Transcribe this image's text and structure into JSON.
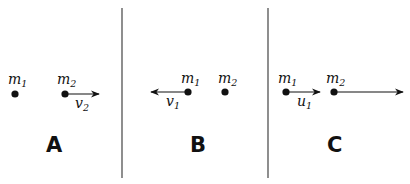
{
  "panels": [
    {
      "id": "A",
      "label": "A",
      "masses": [
        {
          "name": "m",
          "sub": "1"
        },
        {
          "name": "m",
          "sub": "2"
        }
      ],
      "vectors": [
        {
          "from_mass": 2,
          "direction": "right",
          "name": "v",
          "sub": "2"
        }
      ]
    },
    {
      "id": "B",
      "label": "B",
      "masses": [
        {
          "name": "m",
          "sub": "1"
        },
        {
          "name": "m",
          "sub": "2"
        }
      ],
      "vectors": [
        {
          "from_mass": 1,
          "direction": "left",
          "name": "v",
          "sub": "1"
        }
      ]
    },
    {
      "id": "C",
      "label": "C",
      "masses": [
        {
          "name": "m",
          "sub": "1"
        },
        {
          "name": "m",
          "sub": "2"
        }
      ],
      "vectors": [
        {
          "from_mass": 1,
          "direction": "right",
          "name": "u",
          "sub": "1"
        },
        {
          "from_mass": 2,
          "direction": "right",
          "name": "",
          "sub": ""
        }
      ]
    }
  ]
}
